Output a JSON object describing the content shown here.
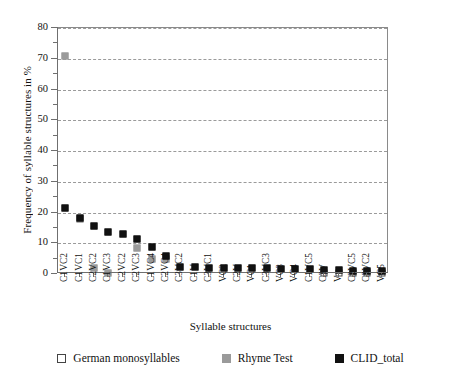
{
  "chart_data": {
    "type": "scatter",
    "title": "",
    "xlabel": "Syllable structures",
    "ylabel": "Frequency of syllable structures in %",
    "ylim": [
      0,
      80
    ],
    "ytick_step": 10,
    "yticks": [
      0,
      10,
      20,
      30,
      40,
      50,
      60,
      70,
      80
    ],
    "ytick_labels": [
      "0",
      "10",
      "20",
      "30",
      "40",
      "50",
      "60",
      "70",
      "80"
    ],
    "minor_ytick_step": 5,
    "grid": "horizontal-dashed",
    "legend_position": "bottom",
    "categories": [
      "C1VC2",
      "C1VC1",
      "C2VC2",
      "C1VC3",
      "C2VC2",
      "C2VC3",
      "C1VC4",
      "C2VC4",
      "C3VC2",
      "C1V",
      "C3VC1",
      "VC2",
      "C2V",
      "VC1",
      "C3VC3",
      "VC3",
      "VC4",
      "C1VC5",
      "C3V",
      "V",
      "C2VC5",
      "C3VC2",
      "VC5"
    ],
    "series": [
      {
        "name": "German monosyllables",
        "marker": "open-square",
        "color": "#ffffff",
        "edge_color": "#444444",
        "values": [
          null,
          null,
          null,
          null,
          null,
          null,
          null,
          null,
          null,
          null,
          null,
          null,
          null,
          null,
          null,
          null,
          null,
          null,
          0.4,
          0.4,
          0.4,
          0.4,
          0.4
        ]
      },
      {
        "name": "Rhyme Test",
        "marker": "filled-square",
        "color": "#9a9a9a",
        "values": [
          71.0,
          18.0,
          2.0,
          0.3,
          null,
          8.6,
          5.0,
          5.0,
          null,
          null,
          null,
          null,
          null,
          null,
          null,
          null,
          null,
          null,
          null,
          null,
          null,
          null,
          null
        ]
      },
      {
        "name": "CLID_total",
        "marker": "filled-square",
        "color": "#111111",
        "values": [
          21.5,
          18.3,
          15.7,
          13.8,
          13.0,
          11.4,
          8.8,
          5.8,
          2.4,
          2.2,
          2.1,
          2.0,
          2.0,
          1.9,
          1.8,
          1.7,
          1.6,
          1.5,
          1.4,
          1.2,
          1.1,
          1.0,
          0.9
        ]
      }
    ]
  },
  "legend": {
    "items": [
      {
        "label": "German monosyllables",
        "swatch": "s-mono"
      },
      {
        "label": "Rhyme Test",
        "swatch": "s-rhyme"
      },
      {
        "label": "CLID_total",
        "swatch": "s-clid"
      }
    ]
  }
}
